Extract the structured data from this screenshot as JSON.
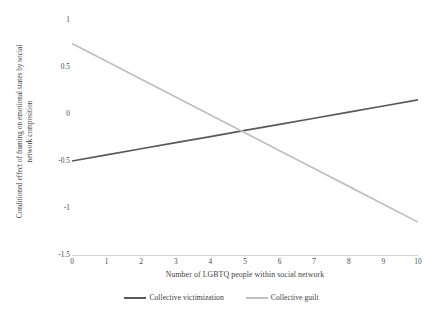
{
  "chart_data": {
    "type": "line",
    "title": "",
    "xlabel": "Number of LGBTQ people within social network",
    "ylabel_line1": "Conditioned effect of framing on emotional states by social",
    "ylabel_line2": "network composition",
    "x": [
      0,
      1,
      2,
      3,
      4,
      5,
      6,
      7,
      8,
      9,
      10
    ],
    "xticklabels": [
      "0",
      "1",
      "2",
      "3",
      "4",
      "5",
      "6",
      "7",
      "8",
      "9",
      "10"
    ],
    "yticklabels": [
      "1",
      "0.5",
      "0",
      "-0.5",
      "-1",
      "-1.5"
    ],
    "yticks": [
      1,
      0.5,
      0,
      -0.5,
      -1,
      -1.5
    ],
    "xlim": [
      0,
      10
    ],
    "ylim": [
      -1.5,
      1
    ],
    "grid": false,
    "legend_position": "bottom",
    "series": [
      {
        "name": "Collective victimization",
        "color": "#595959",
        "values": [
          -0.5,
          -0.435,
          -0.37,
          -0.305,
          -0.24,
          -0.175,
          -0.11,
          -0.045,
          0.02,
          0.085,
          0.15
        ]
      },
      {
        "name": "Collective guilt",
        "color": "#bfbfbf",
        "values": [
          0.75,
          0.56,
          0.37,
          0.18,
          -0.01,
          -0.2,
          -0.39,
          -0.58,
          -0.77,
          -0.96,
          -1.15
        ]
      }
    ],
    "annotations": {
      "intersection_x": 4.9,
      "intersection_y": -0.18
    }
  },
  "legend": {
    "items": [
      {
        "label": "Collective victimization",
        "color": "#595959"
      },
      {
        "label": "Collective guilt",
        "color": "#bfbfbf"
      }
    ]
  },
  "axes": {
    "axis_line_color": "#d4d4d4",
    "tick_text_color": "#4a4a4a"
  }
}
